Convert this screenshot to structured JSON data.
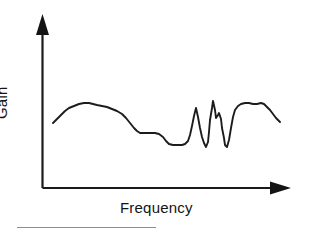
{
  "figure": {
    "name": "gain-versus-frequency-response-curve",
    "background_color": "#ffffff",
    "line_color": "#1c1c1c",
    "axis_color": "#1a1a1a",
    "footer_rule_color": "#8e8e8e"
  },
  "labels": {
    "y_axis": "Gain",
    "x_axis": "Frequency"
  },
  "chart_data": {
    "type": "line",
    "title": "",
    "subtitle": "",
    "xlabel": "Frequency",
    "ylabel": "Gain",
    "grid": false,
    "legend": null,
    "axis_style": "arrow-axes-unlabeled",
    "tick_labels_x": [],
    "tick_labels_y": [],
    "xlim": [
      0,
      1
    ],
    "ylim": [
      0,
      1
    ],
    "note": "Schematic frequency response: rising low-frequency shoulder, broad plateau, step down to a mid shelf, trough, a burst of sharp narrow resonant spikes and notches, a second plateau, then a roll-off.",
    "series": [
      {
        "name": "gain response",
        "points_px": [
          [
            53,
            123
          ],
          [
            57,
            119
          ],
          [
            61,
            115
          ],
          [
            65,
            111
          ],
          [
            69,
            108
          ],
          [
            74,
            106
          ],
          [
            79,
            104
          ],
          [
            84,
            103
          ],
          [
            89,
            103
          ],
          [
            93,
            104
          ],
          [
            97,
            105
          ],
          [
            102,
            106
          ],
          [
            107,
            107
          ],
          [
            112,
            109
          ],
          [
            117,
            111
          ],
          [
            122,
            114
          ],
          [
            126,
            118
          ],
          [
            130,
            123
          ],
          [
            134,
            128
          ],
          [
            137,
            131
          ],
          [
            140,
            133
          ],
          [
            145,
            133
          ],
          [
            150,
            133
          ],
          [
            155,
            133
          ],
          [
            159,
            134
          ],
          [
            163,
            137
          ],
          [
            166,
            141
          ],
          [
            169,
            144
          ],
          [
            173,
            145
          ],
          [
            178,
            145
          ],
          [
            182,
            145
          ],
          [
            185,
            144
          ],
          [
            188,
            141
          ],
          [
            190,
            135
          ],
          [
            192,
            126
          ],
          [
            194,
            116
          ],
          [
            196,
            108
          ],
          [
            198,
            117
          ],
          [
            200,
            128
          ],
          [
            202,
            137
          ],
          [
            204,
            143
          ],
          [
            206,
            147
          ],
          [
            208,
            142
          ],
          [
            209,
            132
          ],
          [
            210,
            120
          ],
          [
            212,
            108
          ],
          [
            213,
            101
          ],
          [
            215,
            110
          ],
          [
            216,
            118
          ],
          [
            218,
            115
          ],
          [
            219,
            113
          ],
          [
            221,
            119
          ],
          [
            222,
            128
          ],
          [
            224,
            138
          ],
          [
            225,
            145
          ],
          [
            227,
            147
          ],
          [
            229,
            140
          ],
          [
            231,
            128
          ],
          [
            233,
            117
          ],
          [
            235,
            110
          ],
          [
            238,
            106
          ],
          [
            241,
            104
          ],
          [
            245,
            103
          ],
          [
            249,
            103
          ],
          [
            253,
            104
          ],
          [
            257,
            104
          ],
          [
            261,
            103
          ],
          [
            264,
            104
          ],
          [
            267,
            107
          ],
          [
            270,
            110
          ],
          [
            273,
            114
          ],
          [
            276,
            118
          ],
          [
            280,
            122
          ]
        ]
      }
    ],
    "annotations": []
  },
  "axes": {
    "y_axis": {
      "x": 42,
      "y_top": 18,
      "y_bottom": 188,
      "arrow": "up"
    },
    "x_axis": {
      "y": 188,
      "x_left": 42,
      "x_right": 290,
      "arrow": "right"
    }
  }
}
